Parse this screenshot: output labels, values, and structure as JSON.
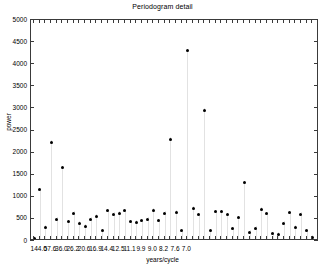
{
  "chart_data": {
    "type": "scatter",
    "title": "Periodogram detail",
    "xlabel": "years/cycle",
    "ylabel": "power",
    "ylim": [
      0,
      5000
    ],
    "ytick_values": [
      0,
      500,
      1000,
      1500,
      2000,
      2500,
      3000,
      3500,
      4000,
      4500,
      5000
    ],
    "ytick_labels": [
      "0",
      "500",
      "1000",
      "1500",
      "2000",
      "2500",
      "3000",
      "3500",
      "4000",
      "4500",
      "5000"
    ],
    "xtick_labels": [
      "144.0",
      "57.6",
      "36.0",
      "26.2",
      "20.6",
      "16.9",
      "14.4",
      "12.5",
      "11.1",
      "9.9",
      "9.0",
      "8.2",
      "7.6",
      "7.0"
    ],
    "xtick_positions": [
      1,
      3,
      5,
      7,
      9,
      11,
      13,
      15,
      17,
      19,
      21,
      23,
      25,
      27
    ],
    "grid": false,
    "legend": null,
    "marker": "filled-circle",
    "marker_color": "#000000",
    "stem_color": "#e2e2e2",
    "x_index_range": [
      0,
      37
    ],
    "points": [
      {
        "index": 0,
        "x_label": "",
        "power": 60
      },
      {
        "index": 1,
        "x_label": "144.0",
        "power": 1160
      },
      {
        "index": 2,
        "x_label": "",
        "power": 310
      },
      {
        "index": 3,
        "x_label": "57.6",
        "power": 2230
      },
      {
        "index": 4,
        "x_label": "",
        "power": 490
      },
      {
        "index": 5,
        "x_label": "36.0",
        "power": 1660
      },
      {
        "index": 6,
        "x_label": "",
        "power": 430
      },
      {
        "index": 7,
        "x_label": "26.2",
        "power": 630
      },
      {
        "index": 8,
        "x_label": "",
        "power": 400
      },
      {
        "index": 9,
        "x_label": "20.6",
        "power": 330
      },
      {
        "index": 10,
        "x_label": "",
        "power": 490
      },
      {
        "index": 11,
        "x_label": "16.9",
        "power": 560
      },
      {
        "index": 12,
        "x_label": "",
        "power": 230
      },
      {
        "index": 13,
        "x_label": "14.4",
        "power": 690
      },
      {
        "index": 14,
        "x_label": "",
        "power": 600
      },
      {
        "index": 15,
        "x_label": "12.5",
        "power": 630
      },
      {
        "index": 16,
        "x_label": "",
        "power": 680
      },
      {
        "index": 17,
        "x_label": "11.1",
        "power": 430
      },
      {
        "index": 18,
        "x_label": "",
        "power": 420
      },
      {
        "index": 19,
        "x_label": "9.9",
        "power": 460
      },
      {
        "index": 20,
        "x_label": "",
        "power": 490
      },
      {
        "index": 21,
        "x_label": "9.0",
        "power": 700
      },
      {
        "index": 22,
        "x_label": "",
        "power": 460
      },
      {
        "index": 23,
        "x_label": "8.2",
        "power": 630
      },
      {
        "index": 24,
        "x_label": "",
        "power": 2300
      },
      {
        "index": 25,
        "x_label": "7.6",
        "power": 650
      },
      {
        "index": 26,
        "x_label": "",
        "power": 230
      },
      {
        "index": 27,
        "x_label": "7.0",
        "power": 4300
      },
      {
        "index": 28,
        "x_label": "",
        "power": 740
      },
      {
        "index": 29,
        "x_label": "",
        "power": 590
      },
      {
        "index": 30,
        "x_label": "",
        "power": 2960
      },
      {
        "index": 31,
        "x_label": "",
        "power": 230
      },
      {
        "index": 32,
        "x_label": "",
        "power": 660
      },
      {
        "index": 33,
        "x_label": "",
        "power": 660
      },
      {
        "index": 34,
        "x_label": "",
        "power": 590
      },
      {
        "index": 35,
        "x_label": "",
        "power": 280
      },
      {
        "index": 36,
        "x_label": "",
        "power": 530
      },
      {
        "index": 37,
        "x_label": "",
        "power": 1320
      },
      {
        "index": 38,
        "x_label": "",
        "power": 200
      },
      {
        "index": 39,
        "x_label": "",
        "power": 290
      },
      {
        "index": 40,
        "x_label": "",
        "power": 720
      },
      {
        "index": 41,
        "x_label": "",
        "power": 620
      },
      {
        "index": 42,
        "x_label": "",
        "power": 160
      },
      {
        "index": 43,
        "x_label": "",
        "power": 150
      },
      {
        "index": 44,
        "x_label": "",
        "power": 400
      },
      {
        "index": 45,
        "x_label": "",
        "power": 640
      },
      {
        "index": 46,
        "x_label": "",
        "power": 310
      },
      {
        "index": 47,
        "x_label": "",
        "power": 600
      },
      {
        "index": 48,
        "x_label": "",
        "power": 230
      },
      {
        "index": 49,
        "x_label": "",
        "power": 80
      }
    ]
  }
}
